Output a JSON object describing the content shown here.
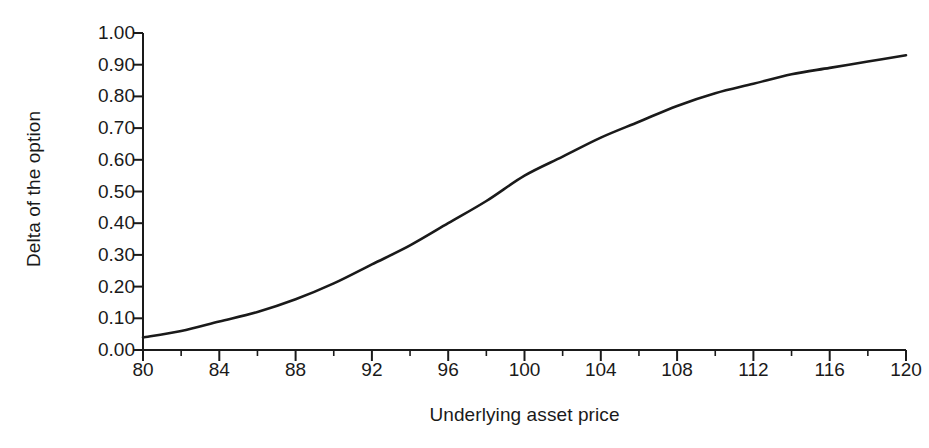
{
  "chart_data": {
    "type": "line",
    "title": "",
    "xlabel": "Underlying asset price",
    "ylabel": "Delta of the option",
    "xlim": [
      80,
      120
    ],
    "ylim": [
      0.0,
      1.0
    ],
    "grid": false,
    "legend": "none",
    "x_ticks": [
      "80",
      "84",
      "88",
      "92",
      "96",
      "100",
      "104",
      "108",
      "112",
      "116",
      "120"
    ],
    "x_tick_values": [
      80,
      84,
      88,
      92,
      96,
      100,
      104,
      108,
      112,
      116,
      120
    ],
    "x_minor_tick_values": [
      82,
      86,
      90,
      94,
      98,
      102,
      106,
      110,
      114,
      118
    ],
    "y_ticks": [
      "0.00",
      "0.10",
      "0.20",
      "0.30",
      "0.40",
      "0.50",
      "0.60",
      "0.70",
      "0.80",
      "0.90",
      "1.00"
    ],
    "y_tick_values": [
      0.0,
      0.1,
      0.2,
      0.3,
      0.4,
      0.5,
      0.6,
      0.7,
      0.8,
      0.9,
      1.0
    ],
    "series": [
      {
        "name": "Delta of the option",
        "color": "#1a1a1a",
        "x": [
          80,
          82,
          84,
          86,
          88,
          90,
          92,
          94,
          96,
          98,
          100,
          102,
          104,
          106,
          108,
          110,
          112,
          114,
          116,
          118,
          120
        ],
        "values": [
          0.04,
          0.06,
          0.09,
          0.12,
          0.16,
          0.21,
          0.27,
          0.33,
          0.4,
          0.47,
          0.55,
          0.61,
          0.67,
          0.72,
          0.77,
          0.81,
          0.84,
          0.87,
          0.89,
          0.91,
          0.93
        ]
      }
    ]
  },
  "colors": {
    "line": "#1a1a1a",
    "axis": "#1a1a1a",
    "background": "#ffffff",
    "text": "#1a1a1a"
  }
}
